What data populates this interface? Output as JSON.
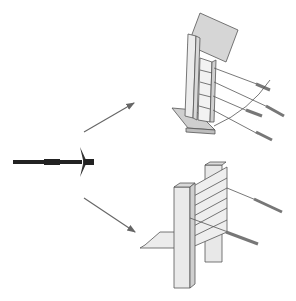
{
  "diagram": {
    "type": "technical-illustration",
    "colors": {
      "background": "#ffffff",
      "line": "#555555",
      "fill_light": "#ececec",
      "fill_mid": "#cfcfcf",
      "bolt": "#222222",
      "arrow": "#666666"
    },
    "nodes": [
      {
        "id": "anchor-bolt",
        "label": "",
        "position": "left-middle"
      },
      {
        "id": "inclined-wall-with-anchors",
        "label": "",
        "position": "top-right"
      },
      {
        "id": "post-and-plank-wall-with-anchors",
        "label": "",
        "position": "bottom-right"
      }
    ],
    "edges": [
      {
        "from": "anchor-bolt",
        "to": "inclined-wall-with-anchors"
      },
      {
        "from": "anchor-bolt",
        "to": "post-and-plank-wall-with-anchors"
      }
    ]
  }
}
